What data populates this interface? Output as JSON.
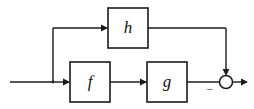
{
  "diagram": {
    "type": "control-system-block-diagram",
    "canvas": {
      "width": 254,
      "height": 109,
      "background": "#ffffff"
    },
    "stroke_color": "#1b1b1b",
    "blocks": [
      {
        "id": "h",
        "label": "h",
        "x": 108,
        "y": 8,
        "width": 40,
        "height": 40,
        "cx": 128,
        "cy": 28
      },
      {
        "id": "f",
        "label": "f",
        "x": 70,
        "y": 62,
        "width": 40,
        "height": 40,
        "cx": 90,
        "cy": 82
      },
      {
        "id": "g",
        "label": "g",
        "x": 147,
        "y": 62,
        "width": 40,
        "height": 40,
        "cx": 167,
        "cy": 82
      }
    ],
    "junction": {
      "id": "sum",
      "cx": 226,
      "cy": 82,
      "r": 6.5,
      "sign_label": "−",
      "sign_x": 210,
      "sign_y": 90
    },
    "signals": {
      "input_label": "",
      "output_label": ""
    },
    "wires": [
      {
        "id": "input-to-branch",
        "path": "M 10 82 L 53 82"
      },
      {
        "id": "branch-riser",
        "path": "M 53 82 L 53 28"
      },
      {
        "id": "branch-to-h",
        "path": "M 53 28 L 106 28"
      },
      {
        "id": "h-to-corner",
        "path": "M 148 28 L 226 28"
      },
      {
        "id": "corner-to-sum",
        "path": "M 226 28 L 226 73"
      },
      {
        "id": "branch-to-f",
        "path": "M 53 82 L 68 82"
      },
      {
        "id": "f-to-g",
        "path": "M 110 82 L 145 82"
      },
      {
        "id": "g-to-sum",
        "path": "M 187 82 L 219 82"
      },
      {
        "id": "sum-to-output",
        "path": "M 232.5 82 L 245 82"
      }
    ],
    "arrowheads": [
      {
        "id": "arrow-into-h",
        "x": 108,
        "y": 28,
        "dir": "right"
      },
      {
        "id": "arrow-into-sum-top",
        "x": 226,
        "y": 75.5,
        "dir": "down"
      },
      {
        "id": "arrow-into-f",
        "x": 70,
        "y": 82,
        "dir": "right"
      },
      {
        "id": "arrow-into-g",
        "x": 147,
        "y": 82,
        "dir": "right"
      },
      {
        "id": "arrow-output",
        "x": 248,
        "y": 82,
        "dir": "right"
      }
    ]
  }
}
